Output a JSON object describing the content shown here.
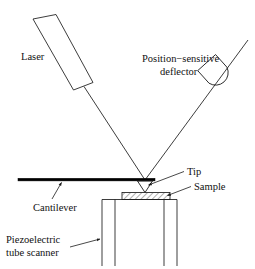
{
  "figure": {
    "width": 255,
    "height": 269,
    "background_color": "#ffffff",
    "line_color": "#1a1a1a"
  },
  "labels": {
    "laser": "Laser",
    "detector_line1": "Position−sensitive",
    "detector_line2": "deflector",
    "tip": "Tip",
    "sample": "Sample",
    "cantilever": "Cantilever",
    "scanner_line1": "Piezoelectric",
    "scanner_line2": "tube scanner"
  },
  "components": {
    "laser_source": {
      "name": "laser-source",
      "shape": "tilted-rectangle",
      "points": "33,19 56,14 93,83 73,90"
    },
    "detector": {
      "name": "position-sensitive-detector",
      "shape": "dome",
      "description": "bullet/dome shape tilted toward incoming beam"
    },
    "incident_beam": {
      "name": "incident-laser-beam",
      "from": "84,87",
      "to": "145,180"
    },
    "reflected_beam": {
      "name": "reflected-laser-beam",
      "from": "145,180",
      "to": "248,40"
    },
    "cantilever": {
      "name": "cantilever-beam",
      "x1": 18,
      "y1": 180,
      "x2": 155,
      "y2": 180
    },
    "tip": {
      "name": "probe-tip",
      "shape": "downward-triangle",
      "apex": "145,192"
    },
    "sample": {
      "name": "sample-slab",
      "x": 122,
      "y": 192,
      "width": 48,
      "height": 7,
      "fill": "diagonal-hatch"
    },
    "scanner": {
      "name": "piezoelectric-tube-scanner",
      "outer_left": 102,
      "inner_left": 115,
      "inner_right": 164,
      "outer_right": 177,
      "top": 199,
      "bottom": 266
    }
  },
  "leaders": [
    {
      "name": "leader-tip",
      "label": "Tip",
      "from": "185,172",
      "to": "147,186"
    },
    {
      "name": "leader-sample",
      "label": "Sample",
      "from": "190,187",
      "to": "166,196"
    },
    {
      "name": "leader-cantilever",
      "label": "Cantilever",
      "from": "52,198",
      "to": "62,182"
    },
    {
      "name": "leader-scanner",
      "label": "Piezoelectric tube scanner",
      "from": "72,246",
      "to": "100,239"
    }
  ]
}
